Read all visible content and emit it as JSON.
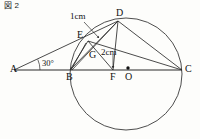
{
  "figure": {
    "caption": "図 2",
    "background_color": "#fdfdfb",
    "stroke_color": "#2b2b2b",
    "text_color": "#111111"
  },
  "labels": {
    "A": "A",
    "B": "B",
    "C": "C",
    "D": "D",
    "E": "E",
    "F": "F",
    "G": "G",
    "O": "O"
  },
  "dimensions": {
    "ed_length": "1cm",
    "gf_length": "2cm"
  },
  "angles": {
    "at_A": "30°"
  },
  "geometry": {
    "circle": {
      "cx": 126,
      "cy": 74,
      "r": 56
    },
    "points": {
      "A": {
        "x": 14,
        "y": 70
      },
      "B": {
        "x": 70,
        "y": 70
      },
      "C": {
        "x": 182,
        "y": 70
      },
      "D": {
        "x": 118,
        "y": 21
      },
      "E": {
        "x": 88,
        "y": 41
      },
      "F": {
        "x": 113,
        "y": 70
      },
      "G": {
        "x": 96,
        "y": 52
      },
      "O": {
        "x": 128,
        "y": 69
      }
    },
    "segments": [
      [
        "A",
        "D"
      ],
      [
        "A",
        "C"
      ],
      [
        "B",
        "D"
      ],
      [
        "B",
        "E"
      ],
      [
        "E",
        "B"
      ],
      [
        "E",
        "C"
      ],
      [
        "E",
        "F"
      ],
      [
        "D",
        "C"
      ],
      [
        "D",
        "F"
      ],
      [
        "B",
        "F"
      ]
    ]
  }
}
